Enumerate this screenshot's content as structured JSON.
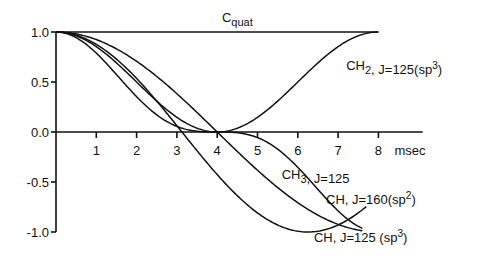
{
  "chart_data": {
    "type": "line",
    "title": "",
    "xlabel": "msec",
    "ylabel": "",
    "xlim": [
      0,
      8
    ],
    "ylim": [
      -1.0,
      1.0
    ],
    "grid": false,
    "x_ticks": [
      "1",
      "2",
      "3",
      "4",
      "5",
      "6",
      "7",
      "8"
    ],
    "y_ticks": [
      "1.0",
      "0.5",
      "0.0",
      "-0.5",
      "-1.0"
    ],
    "y_tick_values": [
      1.0,
      0.5,
      0.0,
      -0.5,
      -1.0
    ],
    "series": [
      {
        "name": "Cquat",
        "label": "C",
        "label_sub": "quat",
        "label_tail": "",
        "label_sup": "",
        "J": 0,
        "power": 1,
        "kind": "cosine_power",
        "x_end": 8.0
      },
      {
        "name": "CH2, J=125(sp3)",
        "label": "CH",
        "label_sub": "2",
        "label_tail": ", J=125(sp",
        "label_sup": "3",
        "label_end": ")",
        "J": 125,
        "power": 2,
        "kind": "cosine_power",
        "x_end": 8.0
      },
      {
        "name": "CH3, J=125",
        "label": "CH",
        "label_sub": "3",
        "label_tail": ", J=125",
        "label_sup": "",
        "label_end": "",
        "J": 125,
        "power": 3,
        "kind": "cosine_power",
        "x_end": 7.6
      },
      {
        "name": "CH, J=160(sp2)",
        "label": "CH",
        "label_sub": "",
        "label_tail": ", J=160(sp",
        "label_sup": "2",
        "label_end": ")",
        "J": 160,
        "power": 1,
        "kind": "cosine_power",
        "x_end": 7.7
      },
      {
        "name": "CH, J=125 (sp3)",
        "label": "CH",
        "label_sub": "",
        "label_tail": ", J=125 (sp",
        "label_sup": "3",
        "label_end": ")",
        "J": 125,
        "power": 1,
        "kind": "cosine_power",
        "x_end": 7.6
      }
    ]
  }
}
